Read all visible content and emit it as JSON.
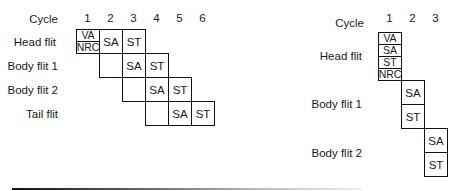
{
  "left_diagram": {
    "cycle_label": "Cycle",
    "cycles": [
      "1",
      "2",
      "3",
      "4",
      "5",
      "6"
    ],
    "rows": [
      {
        "label": "Head flit",
        "start_cycle": 1,
        "stages": [
          [
            "VA",
            "NRC"
          ],
          "SA",
          "ST"
        ]
      },
      {
        "label": "Body flit 1",
        "start_cycle": 2,
        "stages": [
          "",
          "SA",
          "ST"
        ]
      },
      {
        "label": "Body flit 2",
        "start_cycle": 3,
        "stages": [
          "",
          "SA",
          "ST"
        ]
      },
      {
        "label": "Tail flit",
        "start_cycle": 4,
        "stages": [
          "",
          "SA",
          "ST"
        ]
      }
    ]
  },
  "right_diagram": {
    "cycle_label": "Cycle",
    "cycles": [
      "1",
      "2",
      "3"
    ],
    "rows": [
      {
        "label": "Head flit",
        "cycle": 1,
        "stages": [
          "VA",
          "SA",
          "ST",
          "NRC"
        ]
      },
      {
        "label": "Body flit 1",
        "cycle": 2,
        "stages": [
          "SA",
          "ST"
        ]
      },
      {
        "label": "Body flit 2",
        "cycle": 3,
        "stages": [
          "SA",
          "ST"
        ]
      }
    ]
  }
}
